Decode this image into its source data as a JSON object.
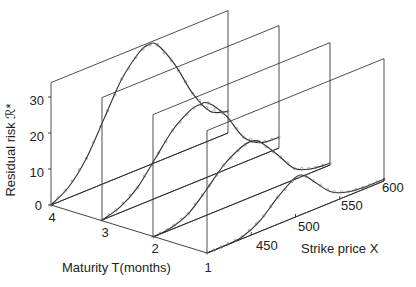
{
  "chart_data": {
    "type": "line",
    "subtype": "3d-waterfall",
    "title": "",
    "xlabel": "Strike price X",
    "ylabel": "Residual risk ℛ*",
    "zlabel": "Maturity T(months)",
    "x_range": [
      400,
      600
    ],
    "x_ticks": [
      450,
      500,
      550,
      600
    ],
    "y_range": [
      0,
      34
    ],
    "y_ticks": [
      0,
      10,
      20,
      30
    ],
    "z_ticks": [
      4,
      3,
      2,
      1
    ],
    "x": [
      400,
      420,
      440,
      460,
      480,
      500,
      510,
      520,
      540,
      560,
      580,
      600
    ],
    "series": [
      {
        "name": "T=4",
        "maturity": 4,
        "values": [
          0,
          3,
          9,
          18,
          27,
          32.5,
          33.5,
          32.5,
          25,
          15,
          8,
          6
        ]
      },
      {
        "name": "T=3",
        "maturity": 3,
        "values": [
          0,
          1.5,
          5,
          11,
          17,
          20.5,
          21,
          20.5,
          15,
          7,
          3.5,
          3
        ]
      },
      {
        "name": "T=2",
        "maturity": 2,
        "values": [
          0,
          0.5,
          2.5,
          7,
          12,
          15,
          15.5,
          14.5,
          9,
          3,
          1,
          0.5
        ]
      },
      {
        "name": "T=1",
        "maturity": 1,
        "values": [
          0,
          0,
          0.5,
          3,
          7.5,
          11,
          10.5,
          8,
          3,
          1,
          0.5,
          0.5
        ]
      }
    ],
    "grid": false,
    "legend": "none"
  },
  "labels": {
    "ylabel": "Residual risk ℛ*",
    "xlabel": "Strike price X",
    "zlabel": "Maturity T(months)",
    "y_ticks": [
      "0",
      "10",
      "20",
      "30"
    ],
    "x_ticks": [
      "450",
      "500",
      "550",
      "600"
    ],
    "z_ticks": [
      "4",
      "3",
      "2",
      "1"
    ]
  }
}
